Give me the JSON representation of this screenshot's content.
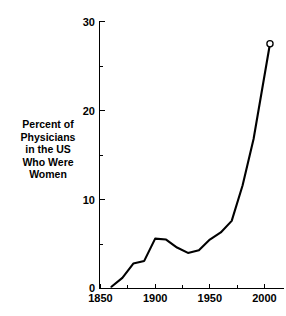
{
  "chart_data": {
    "type": "line",
    "title": "",
    "subtitle": "",
    "xlabel": "",
    "ylabel": "Percent of\nPhysicians\nin the US\nWho Were\nWomen",
    "ylabel_lines": [
      "Percent of",
      "Physicians",
      "in the US",
      "Who Were",
      "Women"
    ],
    "xlim": [
      1850,
      2010
    ],
    "ylim": [
      0,
      30
    ],
    "x_ticks": [
      1850,
      1900,
      1950,
      2000
    ],
    "x_tick_labels": [
      "1850",
      "1900",
      "1950",
      "2000"
    ],
    "x_minor_ticks": [
      1875,
      1925,
      1975
    ],
    "y_ticks": [
      0,
      10,
      20,
      30
    ],
    "y_tick_labels": [
      "0",
      "10",
      "20",
      "30"
    ],
    "y_minor_ticks": [
      5,
      15,
      25
    ],
    "grid": false,
    "legend": false,
    "legend_position": "none",
    "line_color": "#000000",
    "background_color": "#ffffff",
    "marker": "open-circle-endpoint",
    "x": [
      1860,
      1870,
      1880,
      1890,
      1900,
      1910,
      1920,
      1930,
      1940,
      1950,
      1960,
      1970,
      1980,
      1990,
      2005
    ],
    "values": [
      0.2,
      1.2,
      2.8,
      3.1,
      5.6,
      5.5,
      4.6,
      4.0,
      4.3,
      5.5,
      6.3,
      7.6,
      11.6,
      16.8,
      27.5
    ],
    "series": [
      {
        "name": "Percent of Physicians in the US Who Were Women",
        "values": [
          0.2,
          1.2,
          2.8,
          3.1,
          5.6,
          5.5,
          4.6,
          4.0,
          4.3,
          5.5,
          6.3,
          7.6,
          11.6,
          16.8,
          27.5
        ]
      }
    ]
  },
  "axes": {
    "y_axis_name": "percent-axis",
    "x_axis_name": "year-axis"
  }
}
